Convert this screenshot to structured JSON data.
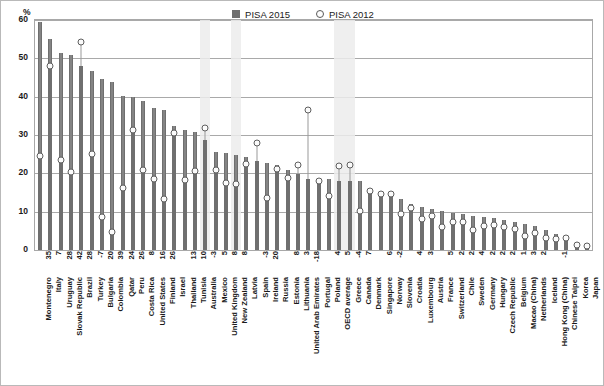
{
  "legend": {
    "series1_label": "PISA 2015",
    "series2_label": "PISA 2012",
    "series1_color": "#6f6f6f",
    "series2_color": "#5e5e5e"
  },
  "axis": {
    "y_unit": "%",
    "y_ticks": [
      "60",
      "50",
      "40",
      "30",
      "20",
      "10",
      "0"
    ],
    "y_min": 0,
    "y_max": 60
  },
  "chart_data": {
    "type": "bar",
    "title": "",
    "subtitle": "",
    "xlabel": "",
    "ylabel": "%",
    "ylim": [
      0,
      60
    ],
    "grid": true,
    "legend_position": "top-center",
    "highlight_categories": [
      "Australia",
      "New Zealand",
      "OECD average",
      "Greece"
    ],
    "value_row_label": "difference",
    "categories": [
      "Montenegro",
      "Italy",
      "Uruguay",
      "Slovak Republic",
      "Brazil",
      "Turkey",
      "Bulgaria",
      "Colombia",
      "Qatar",
      "Peru",
      "Costa Rica",
      "United States",
      "Finland",
      "Israel",
      "Thailand",
      "Tunisia",
      "Australia",
      "Mexico",
      "United Kingdom",
      "New Zealand",
      "Latvia",
      "Spain",
      "Ireland",
      "Russia",
      "Estonia",
      "Lithuania",
      "United Arab Emirates",
      "Portugal",
      "Poland",
      "OECD average",
      "Greece",
      "Canada",
      "Denmark",
      "Singapore",
      "Norway",
      "Slovenia",
      "Croatia",
      "Luxembourg",
      "Austria",
      "France",
      "Switzerland",
      "Chile",
      "Sweden",
      "Germany",
      "Hungary",
      "Czech Republic",
      "Belgium",
      "Macao (China)",
      "Netherlands",
      "Iceland",
      "Hong Kong (China)",
      "Chinese Taipei",
      "Korea",
      "Japan"
    ],
    "difference_labels": [
      "35",
      "7",
      "28",
      "42",
      "28",
      "-7",
      "20",
      "39",
      "24",
      "26",
      "8",
      "16",
      "26",
      "",
      "13",
      "10",
      "-3",
      "5",
      "8",
      "8",
      "",
      "-3",
      "20",
      "",
      "8",
      "3",
      "-18",
      "",
      "4",
      "5",
      "-4",
      "7",
      "",
      "6",
      "-2",
      "",
      "4",
      "3",
      "",
      "5",
      "2",
      "2",
      "4",
      "2",
      "2",
      "2",
      "1",
      "3",
      "2",
      "",
      "-1",
      "",
      "",
      ""
    ],
    "series": [
      {
        "name": "PISA 2015",
        "values": [
          59.5,
          55.0,
          51.3,
          51.0,
          48.0,
          46.8,
          44.5,
          43.8,
          40.2,
          40.0,
          39.0,
          37.1,
          36.6,
          32.3,
          31.2,
          30.8,
          28.8,
          25.6,
          25.2,
          24.8,
          24.2,
          23.2,
          22.8,
          22.3,
          21.0,
          19.9,
          18.5,
          18.5,
          18.5,
          18.1,
          17.9,
          17.9,
          15.4,
          14.6,
          14.3,
          13.3,
          11.9,
          11.2,
          10.6,
          10.2,
          9.6,
          9.3,
          9.0,
          8.5,
          8.3,
          7.8,
          7.3,
          6.8,
          6.2,
          5.3,
          4.1,
          3.1,
          2.0,
          1.6
        ]
      },
      {
        "name": "PISA 2012",
        "values": [
          24.6,
          48.0,
          23.6,
          20.3,
          54.2,
          25.1,
          8.5,
          4.7,
          16.1,
          31.3,
          21.0,
          18.4,
          13.3,
          30.5,
          18.2,
          20.7,
          31.8,
          20.8,
          17.6,
          17.2,
          22.5,
          27.8,
          13.5,
          21.2,
          18.8,
          22.1,
          36.6,
          18.0,
          14.0,
          21.8,
          22.2,
          10.1,
          15.3,
          14.6,
          14.7,
          9.5,
          11.0,
          8.2,
          8.8,
          6.0,
          7.4,
          7.2,
          5.3,
          6.3,
          6.6,
          5.9,
          5.5,
          3.7,
          4.4,
          3.2,
          3.0,
          3.1,
          1.4,
          1.1
        ]
      }
    ]
  }
}
